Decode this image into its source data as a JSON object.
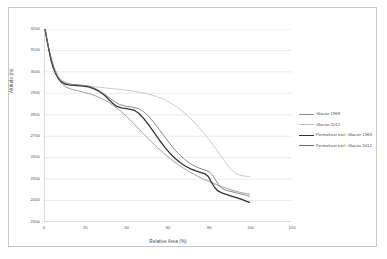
{
  "chart_data": {
    "type": "line",
    "title": "",
    "xlabel": "Relative Area (%)",
    "ylabel": "Altitude (m)",
    "xlim": [
      0,
      120
    ],
    "ylim": [
      2300,
      3200
    ],
    "xticks": [
      0,
      20,
      40,
      60,
      80,
      100,
      120
    ],
    "yticks": [
      2300,
      2400,
      2500,
      2600,
      2700,
      2800,
      2900,
      3000,
      3100,
      3200
    ],
    "grid": "horizontal",
    "legend_position": "right",
    "series": [
      {
        "name": "Glacier 1969",
        "color": "#8c8c8c",
        "width": 0.8,
        "points": [
          [
            0.5,
            3200
          ],
          [
            1.2,
            3160
          ],
          [
            2.0,
            3120
          ],
          [
            3.0,
            3075
          ],
          [
            4.2,
            3035
          ],
          [
            5.5,
            3000
          ],
          [
            7.0,
            2970
          ],
          [
            8.5,
            2946
          ],
          [
            10.5,
            2930
          ],
          [
            13.0,
            2920
          ],
          [
            16.0,
            2913
          ],
          [
            19.0,
            2906
          ],
          [
            22.0,
            2898
          ],
          [
            25.0,
            2888
          ],
          [
            28.0,
            2875
          ],
          [
            31.0,
            2860
          ],
          [
            34.0,
            2840
          ],
          [
            37.0,
            2818
          ],
          [
            40.0,
            2792
          ],
          [
            43.0,
            2763
          ],
          [
            46.0,
            2733
          ],
          [
            49.0,
            2703
          ],
          [
            52.0,
            2674
          ],
          [
            55.0,
            2646
          ],
          [
            58.0,
            2620
          ],
          [
            61.0,
            2596
          ],
          [
            64.0,
            2574
          ],
          [
            67.0,
            2554
          ],
          [
            70.0,
            2536
          ],
          [
            73.0,
            2520
          ],
          [
            76.0,
            2505
          ],
          [
            79.0,
            2492
          ],
          [
            82.0,
            2480
          ],
          [
            85.0,
            2469
          ],
          [
            88.0,
            2458
          ],
          [
            91.0,
            2448
          ],
          [
            94.0,
            2440
          ],
          [
            97.0,
            2434
          ],
          [
            99.5,
            2430
          ]
        ]
      },
      {
        "name": "Glacier 2012",
        "color": "#bfbfbf",
        "width": 0.8,
        "points": [
          [
            0.5,
            3200
          ],
          [
            1.5,
            3150
          ],
          [
            2.6,
            3100
          ],
          [
            3.8,
            3055
          ],
          [
            5.2,
            3015
          ],
          [
            6.8,
            2985
          ],
          [
            8.6,
            2963
          ],
          [
            10.8,
            2950
          ],
          [
            13.5,
            2943
          ],
          [
            17.0,
            2938
          ],
          [
            21.0,
            2934
          ],
          [
            25.0,
            2930
          ],
          [
            29.0,
            2926
          ],
          [
            33.0,
            2922
          ],
          [
            37.0,
            2918
          ],
          [
            41.0,
            2913
          ],
          [
            45.0,
            2907
          ],
          [
            49.0,
            2900
          ],
          [
            53.0,
            2890
          ],
          [
            57.0,
            2876
          ],
          [
            60.0,
            2862
          ],
          [
            63.0,
            2845
          ],
          [
            66.0,
            2824
          ],
          [
            69.0,
            2800
          ],
          [
            72.0,
            2772
          ],
          [
            75.0,
            2740
          ],
          [
            78.0,
            2706
          ],
          [
            80.5,
            2676
          ],
          [
            83.0,
            2644
          ],
          [
            85.0,
            2616
          ],
          [
            87.0,
            2590
          ],
          [
            88.5,
            2568
          ],
          [
            90.0,
            2550
          ],
          [
            91.5,
            2536
          ],
          [
            93.0,
            2526
          ],
          [
            95.0,
            2518
          ],
          [
            97.0,
            2514
          ],
          [
            99.5,
            2512
          ]
        ]
      },
      {
        "name": "Permafrost excl. Glacier 1969",
        "color": "#333333",
        "width": 1.3,
        "points": [
          [
            0.5,
            3200
          ],
          [
            1.4,
            3150
          ],
          [
            2.4,
            3100
          ],
          [
            3.4,
            3055
          ],
          [
            4.5,
            3018
          ],
          [
            5.7,
            2990
          ],
          [
            7.0,
            2968
          ],
          [
            8.6,
            2952
          ],
          [
            10.5,
            2942
          ],
          [
            13.0,
            2938
          ],
          [
            16.0,
            2936
          ],
          [
            19.0,
            2934
          ],
          [
            21.5,
            2930
          ],
          [
            24.0,
            2922
          ],
          [
            26.5,
            2910
          ],
          [
            29.0,
            2893
          ],
          [
            31.0,
            2875
          ],
          [
            33.0,
            2856
          ],
          [
            35.0,
            2840
          ],
          [
            37.5,
            2832
          ],
          [
            40.5,
            2828
          ],
          [
            43.5,
            2822
          ],
          [
            46.0,
            2806
          ],
          [
            48.5,
            2780
          ],
          [
            51.0,
            2748
          ],
          [
            53.5,
            2714
          ],
          [
            56.0,
            2680
          ],
          [
            58.5,
            2648
          ],
          [
            61.0,
            2620
          ],
          [
            63.5,
            2596
          ],
          [
            66.0,
            2576
          ],
          [
            68.5,
            2560
          ],
          [
            71.0,
            2548
          ],
          [
            73.5,
            2538
          ],
          [
            76.0,
            2530
          ],
          [
            78.0,
            2524
          ],
          [
            79.5,
            2512
          ],
          [
            81.0,
            2486
          ],
          [
            82.5,
            2462
          ],
          [
            84.0,
            2446
          ],
          [
            86.0,
            2436
          ],
          [
            88.5,
            2428
          ],
          [
            91.0,
            2420
          ],
          [
            93.5,
            2412
          ],
          [
            96.0,
            2404
          ],
          [
            98.0,
            2396
          ],
          [
            99.5,
            2392
          ]
        ]
      },
      {
        "name": "Permafrost excl. Glacier 2012",
        "color": "#6e6e6e",
        "width": 0.8,
        "points": [
          [
            0.5,
            3200
          ],
          [
            1.5,
            3148
          ],
          [
            2.6,
            3098
          ],
          [
            3.8,
            3052
          ],
          [
            5.0,
            3012
          ],
          [
            6.4,
            2982
          ],
          [
            8.0,
            2960
          ],
          [
            10.0,
            2948
          ],
          [
            12.5,
            2942
          ],
          [
            15.5,
            2940
          ],
          [
            18.5,
            2938
          ],
          [
            21.5,
            2934
          ],
          [
            24.0,
            2926
          ],
          [
            26.5,
            2914
          ],
          [
            29.0,
            2898
          ],
          [
            31.5,
            2880
          ],
          [
            34.0,
            2862
          ],
          [
            36.5,
            2848
          ],
          [
            39.5,
            2840
          ],
          [
            42.5,
            2836
          ],
          [
            45.5,
            2830
          ],
          [
            48.0,
            2816
          ],
          [
            50.5,
            2794
          ],
          [
            53.0,
            2766
          ],
          [
            55.5,
            2734
          ],
          [
            58.0,
            2702
          ],
          [
            60.5,
            2670
          ],
          [
            63.0,
            2640
          ],
          [
            65.5,
            2614
          ],
          [
            68.0,
            2592
          ],
          [
            70.5,
            2574
          ],
          [
            73.0,
            2560
          ],
          [
            75.5,
            2550
          ],
          [
            78.0,
            2542
          ],
          [
            80.0,
            2534
          ],
          [
            81.5,
            2520
          ],
          [
            83.0,
            2496
          ],
          [
            84.5,
            2474
          ],
          [
            86.0,
            2458
          ],
          [
            88.0,
            2448
          ],
          [
            90.5,
            2442
          ],
          [
            93.0,
            2436
          ],
          [
            95.5,
            2430
          ],
          [
            98.0,
            2424
          ],
          [
            99.5,
            2420
          ]
        ]
      }
    ]
  },
  "axis": {
    "y_labels": [
      "3200",
      "3100",
      "3000",
      "2900",
      "2800",
      "2700",
      "2600",
      "2500",
      "2400",
      "2300"
    ],
    "x_labels": [
      "0",
      "20",
      "40",
      "60",
      "80",
      "100",
      "120"
    ],
    "y_title": "Altitude (m)",
    "x_title": "Relative Area (%)"
  },
  "legend": {
    "items": [
      {
        "label": "Glacier 1969"
      },
      {
        "label": "Glacier 2012"
      },
      {
        "label": "Permafrost excl. Glacier 1969"
      },
      {
        "label": "Permafrost excl. Glacier 2012"
      }
    ]
  },
  "colors": {
    "grid": "#d6d6d6",
    "axis": "#8c8c8c",
    "frame": "#c9c9c9",
    "text": "#585858"
  }
}
